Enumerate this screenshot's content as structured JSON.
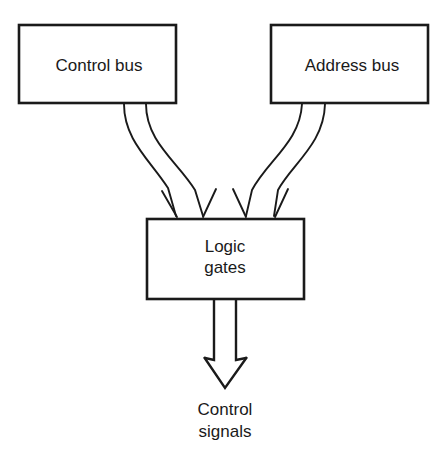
{
  "diagram": {
    "background_color": "#ffffff",
    "line_color": "#1a1a1a",
    "nodes": [
      {
        "id": "control-bus",
        "label": "Control bus",
        "shape": "rectangle",
        "x": 19,
        "y": 25,
        "width": 157,
        "height": 78
      },
      {
        "id": "address-bus",
        "label": "Address bus",
        "shape": "rectangle",
        "x": 271,
        "y": 25,
        "width": 157,
        "height": 78
      },
      {
        "id": "logic-gates",
        "label_line1": "Logic",
        "label_line2": "gates",
        "shape": "rectangle",
        "x": 147,
        "y": 219,
        "width": 157,
        "height": 80
      }
    ],
    "output": {
      "id": "control-signals",
      "label_line1": "Control",
      "label_line2": "signals",
      "arrow_style": "hollow-open-arrow",
      "tip_x": 225,
      "tip_y": 388
    },
    "edges": [
      {
        "id": "edge-control-1",
        "from": "control-bus",
        "to": "logic-gates",
        "arrowhead": "open-barb"
      },
      {
        "id": "edge-control-2",
        "from": "control-bus",
        "to": "logic-gates",
        "arrowhead": "open-barb"
      },
      {
        "id": "edge-address-1",
        "from": "address-bus",
        "to": "logic-gates",
        "arrowhead": "open-barb"
      },
      {
        "id": "edge-address-2",
        "from": "address-bus",
        "to": "logic-gates",
        "arrowhead": "open-barb"
      }
    ]
  }
}
